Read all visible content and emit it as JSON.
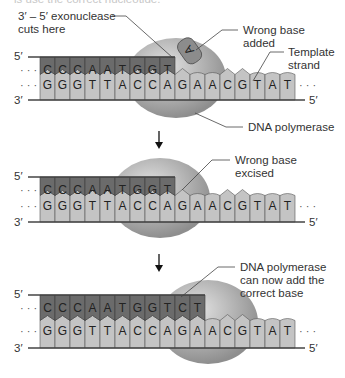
{
  "colors": {
    "new_strand": "#6b6b6b",
    "template_strand": "#c4c4c4",
    "polymerase": "#a8a8a8",
    "wrong_base": "#8c8c8c",
    "line": "#444444",
    "background": "#ffffff"
  },
  "top_caption_cut": "is use the correct nucleotide.",
  "panels": [
    {
      "new_strand_bases": [
        "C",
        "C",
        "C",
        "A",
        "A",
        "T",
        "G",
        "G",
        "T"
      ],
      "template_bases": [
        "G",
        "G",
        "G",
        "T",
        "T",
        "A",
        "C",
        "C",
        "A",
        "G",
        "A",
        "A",
        "C",
        "G",
        "T",
        "A",
        "T"
      ],
      "wrong_base": "A",
      "labels": {
        "exonuclease": [
          "3′ – 5′ exonuclease",
          "cuts here"
        ],
        "wrong_base": [
          "Wrong base",
          "added"
        ],
        "template": [
          "Template",
          "strand"
        ],
        "polymerase": "DNA polymerase"
      },
      "ends": {
        "top_left": "5′",
        "bottom_left": "3′",
        "bottom_right": "5′",
        "ellipsis": "· · ·"
      }
    },
    {
      "new_strand_bases": [
        "C",
        "C",
        "C",
        "A",
        "A",
        "T",
        "G",
        "G",
        "T"
      ],
      "template_bases": [
        "G",
        "G",
        "G",
        "T",
        "T",
        "A",
        "C",
        "C",
        "A",
        "G",
        "A",
        "A",
        "C",
        "G",
        "T",
        "A",
        "T"
      ],
      "labels": {
        "wrong_base": [
          "Wrong base",
          "excised"
        ]
      },
      "ends": {
        "top_left": "5′",
        "bottom_left": "3′",
        "bottom_right": "5′",
        "ellipsis": "· · ·"
      }
    },
    {
      "new_strand_bases": [
        "C",
        "C",
        "C",
        "A",
        "A",
        "T",
        "G",
        "G",
        "T",
        "C",
        "T"
      ],
      "template_bases": [
        "G",
        "G",
        "G",
        "T",
        "T",
        "A",
        "C",
        "C",
        "A",
        "G",
        "A",
        "A",
        "C",
        "G",
        "T",
        "A",
        "T"
      ],
      "labels": {
        "polymerase": [
          "DNA polymerase",
          "can now add the",
          "correct base"
        ]
      },
      "ends": {
        "top_left": "5′",
        "bottom_left": "3′",
        "bottom_right": "5′",
        "ellipsis": "· · ·"
      }
    }
  ],
  "arrow_icon": "down-arrow"
}
